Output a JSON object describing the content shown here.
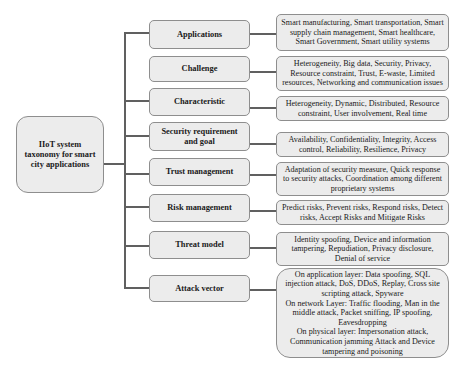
{
  "root": {
    "label": "IIoT system taxonomy for smart city applications"
  },
  "categories": [
    {
      "label": "Applications",
      "description": "Smart manufacturing, Smart transportation, Smart supply chain management, Smart healthcare, Smart Government, Smart utility systems"
    },
    {
      "label": "Challenge",
      "description": "Heterogeneity, Big data, Security, Privacy, Resource constraint, Trust, E-waste, Limited resources, Networking  and communication issues"
    },
    {
      "label": "Characteristic",
      "description": "Heterogeneity, Dynamic, Distributed, Resource constraint, User involvement, Real time"
    },
    {
      "label": "Security requirement and goal",
      "description": "Availability, Confidentiality, Integrity, Access control, Reliability, Resilience, Privacy"
    },
    {
      "label": "Trust management",
      "description": "Adaptation of security measure, Quick response to security attacks, Coordination among different proprietary systems"
    },
    {
      "label": "Risk management",
      "description": "Predict risks, Prevent risks, Respond risks, Detect risks, Accept Risks and Mitigate Risks"
    },
    {
      "label": "Threat model",
      "description": "Identity spoofing, Device and information tampering,  Repudiation, Privacy disclosure, Denial of service"
    },
    {
      "label": "Attack vector",
      "description_lines": [
        "On application layer: Data spoofing, SQL injection attack, DoS, DDoS, Replay, Cross site scripting attack, Spyware",
        "On network Layer: Traffic flooding, Man in the middle attack, Packet sniffing, IP spoofing, Eavesdropping",
        "On physical  layer: Impersonation attack, Communication jamming Attack and Device tampering and poisoning"
      ]
    }
  ]
}
